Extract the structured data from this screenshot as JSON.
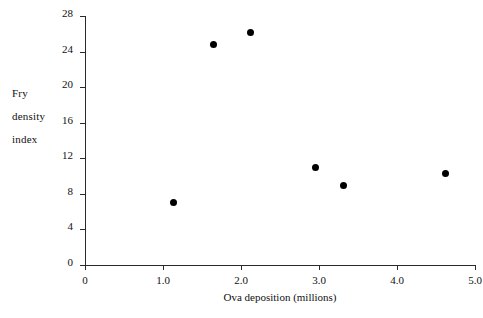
{
  "chart_data": {
    "type": "scatter",
    "title": "",
    "xlabel": "Ova deposition (millions)",
    "ylabel": "Fry density index",
    "ylabel_lines": [
      "Fry",
      "density",
      "index"
    ],
    "xlim": [
      0,
      5.0
    ],
    "ylim": [
      0,
      28
    ],
    "grid": false,
    "legend": null,
    "xticks": [
      0,
      1.0,
      2.0,
      3.0,
      4.0,
      5.0
    ],
    "xtick_labels": [
      "0",
      "1.0",
      "2.0",
      "3.0",
      "4.0",
      "5.0"
    ],
    "yticks": [
      0,
      4,
      8,
      12,
      16,
      20,
      24,
      28
    ],
    "ytick_labels": [
      "0",
      "4",
      "8",
      "12",
      "16",
      "20",
      "24",
      "28"
    ],
    "marker": "filled-circle",
    "marker_color": "#000000",
    "axis_color": "#2a2a2a",
    "points": [
      {
        "x": 1.13,
        "y": 7.0
      },
      {
        "x": 1.65,
        "y": 24.8
      },
      {
        "x": 2.12,
        "y": 26.2
      },
      {
        "x": 2.95,
        "y": 11.0
      },
      {
        "x": 3.32,
        "y": 8.9
      },
      {
        "x": 4.62,
        "y": 10.3
      }
    ]
  }
}
